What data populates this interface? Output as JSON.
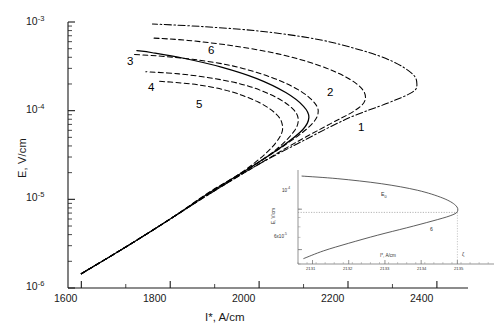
{
  "chart_data": {
    "type": "line",
    "title": "",
    "xlabel": "I*, A/cm",
    "ylabel": "E, V/cm",
    "yscale": "log",
    "xscale": "linear",
    "xlim": [
      1570,
      2470
    ],
    "ylim": [
      1e-06,
      0.001
    ],
    "grid": false,
    "legend": "inline-labels",
    "xticks": [
      1600,
      1800,
      2000,
      2200,
      2400
    ],
    "xtick_labels": [
      "1600",
      "1800",
      "2000",
      "2200",
      "2400"
    ],
    "yticks": [
      1e-06,
      1e-05,
      0.0001,
      0.001
    ],
    "ytick_labels": [
      "10-6",
      "10-5",
      "10-4",
      "10-3"
    ],
    "ytick_mantissa": "10",
    "ytick_exponents": [
      "-6",
      "-5",
      "-4",
      "-3"
    ],
    "series": [
      {
        "name": "1",
        "label": "1",
        "style": "dash-dot",
        "label_x": 2265,
        "label_y": 2.3e-05,
        "turning_point": [
          2350,
          0.00016
        ],
        "points": [
          [
            1600,
            1.45e-06
          ],
          [
            1700,
            2.9e-06
          ],
          [
            1800,
            6e-06
          ],
          [
            1900,
            1.25e-05
          ],
          [
            2000,
            2.5e-05
          ],
          [
            2100,
            4.6e-05
          ],
          [
            2200,
            8.2e-05
          ],
          [
            2290,
            0.000122
          ],
          [
            2345,
            0.000162
          ],
          [
            2355,
            0.0002
          ],
          [
            2345,
            0.00026
          ],
          [
            2300,
            0.00036
          ],
          [
            2230,
            0.00048
          ],
          [
            2130,
            0.00064
          ],
          [
            2000,
            0.00079
          ],
          [
            1870,
            0.00089
          ],
          [
            1760,
            0.00095
          ]
        ]
      },
      {
        "name": "2",
        "label": "2",
        "style": "dashed",
        "label_x": 2175,
        "label_y": 6e-05,
        "turning_point": [
          2235,
          0.00012
        ],
        "points": [
          [
            1600,
            1.45e-06
          ],
          [
            1700,
            2.9e-06
          ],
          [
            1800,
            6e-06
          ],
          [
            1900,
            1.25e-05
          ],
          [
            2000,
            2.5e-05
          ],
          [
            2080,
            4.3e-05
          ],
          [
            2160,
            7.1e-05
          ],
          [
            2215,
            0.0001
          ],
          [
            2238,
            0.00013
          ],
          [
            2232,
            0.000175
          ],
          [
            2195,
            0.00024
          ],
          [
            2130,
            0.00033
          ],
          [
            2040,
            0.00044
          ],
          [
            1940,
            0.00054
          ],
          [
            1840,
            0.00062
          ],
          [
            1760,
            0.00066
          ]
        ]
      },
      {
        "name": "3",
        "label": "3",
        "style": "dashed",
        "label_x": 1718,
        "label_y": 0.00036,
        "turning_point": [
          2130,
          9e-05
        ],
        "points": [
          [
            1600,
            1.45e-06
          ],
          [
            1700,
            2.9e-06
          ],
          [
            1800,
            6e-06
          ],
          [
            1890,
            1.2e-05
          ],
          [
            1975,
            2.2e-05
          ],
          [
            2055,
            4e-05
          ],
          [
            2110,
            6.4e-05
          ],
          [
            2132,
            9e-05
          ],
          [
            2126,
            0.00012
          ],
          [
            2090,
            0.00017
          ],
          [
            2025,
            0.00024
          ],
          [
            1940,
            0.00032
          ],
          [
            1850,
            0.00038
          ],
          [
            1770,
            0.000415
          ],
          [
            1718,
            0.00043
          ]
        ]
      },
      {
        "name": "4",
        "label": "4",
        "style": "dashed",
        "label_x": 1745,
        "label_y": 0.00021,
        "turning_point": [
          2085,
          7.6e-05
        ],
        "points": [
          [
            1600,
            1.45e-06
          ],
          [
            1700,
            2.9e-06
          ],
          [
            1800,
            6e-06
          ],
          [
            1890,
            1.2e-05
          ],
          [
            1970,
            2.1e-05
          ],
          [
            2040,
            3.7e-05
          ],
          [
            2078,
            5.8e-05
          ],
          [
            2088,
            7.8e-05
          ],
          [
            2078,
            0.000102
          ],
          [
            2040,
            0.00014
          ],
          [
            1975,
            0.00019
          ],
          [
            1900,
            0.00023
          ],
          [
            1820,
            0.00026
          ],
          [
            1745,
            0.000275
          ]
        ]
      },
      {
        "name": "5",
        "label": "5",
        "style": "dashed",
        "label_x": 1960,
        "label_y": 4.6e-05,
        "turning_point": [
          2050,
          6.4e-05
        ],
        "points": [
          [
            1600,
            1.45e-06
          ],
          [
            1700,
            2.9e-06
          ],
          [
            1800,
            6e-06
          ],
          [
            1885,
            1.18e-05
          ],
          [
            1960,
            2e-05
          ],
          [
            2018,
            3.4e-05
          ],
          [
            2048,
            5.2e-05
          ],
          [
            2052,
            7e-05
          ],
          [
            2038,
            9.2e-05
          ],
          [
            1998,
            0.000125
          ],
          [
            1935,
            0.000165
          ],
          [
            1865,
            0.000195
          ],
          [
            1800,
            0.00021
          ],
          [
            1770,
            0.000215
          ]
        ]
      },
      {
        "name": "6",
        "label": "6",
        "style": "solid",
        "label_x": 1925,
        "label_y": 0.00045,
        "turning_point": [
          2108,
          8.4e-05
        ],
        "points": [
          [
            1600,
            1.45e-06
          ],
          [
            1700,
            2.9e-06
          ],
          [
            1800,
            6e-06
          ],
          [
            1890,
            1.2e-05
          ],
          [
            1975,
            2.2e-05
          ],
          [
            2050,
            3.9e-05
          ],
          [
            2098,
            6.1e-05
          ],
          [
            2112,
            8.4e-05
          ],
          [
            2100,
            0.000112
          ],
          [
            2060,
            0.00016
          ],
          [
            1995,
            0.00023
          ],
          [
            1915,
            0.00031
          ],
          [
            1830,
            0.00039
          ],
          [
            1760,
            0.00045
          ],
          [
            1725,
            0.000475
          ]
        ]
      }
    ],
    "inset": {
      "type": "line",
      "xlabel": "I*, A/cm",
      "ylabel": "E, V/cm",
      "yscale": "log",
      "xlim": [
        2130.6,
        2135.9
      ],
      "ylim": [
        5e-05,
        0.00016
      ],
      "xticks": [
        2131,
        2132,
        2133,
        2134,
        2135
      ],
      "xtick_labels": [
        "2131",
        "2132",
        "2133",
        "2134",
        "2135"
      ],
      "yticks": [
        6e-05,
        0.0001
      ],
      "ytick_labels": [
        "6x10-5",
        "10-4"
      ],
      "annotations": [
        {
          "name": "E0",
          "text": "E",
          "sub": "0",
          "x": 2133.0,
          "y": 9.6e-05
        },
        {
          "name": "curve-6-label",
          "text": "6",
          "x": 2134.3,
          "y": 6.6e-05
        },
        {
          "name": "zeta",
          "text": "ζ",
          "x": 2135.2,
          "y": 5.4e-05
        }
      ],
      "turning_point": [
        2135.0,
        9.6e-05
      ],
      "points": [
        [
          2130.75,
          5.35e-05
        ],
        [
          2131.3,
          5.9e-05
        ],
        [
          2132.0,
          6.5e-05
        ],
        [
          2132.8,
          7.2e-05
        ],
        [
          2133.6,
          7.9e-05
        ],
        [
          2134.3,
          8.6e-05
        ],
        [
          2134.8,
          9.2e-05
        ],
        [
          2135.0,
          9.7e-05
        ],
        [
          2134.95,
          0.000105
        ],
        [
          2134.6,
          0.000115
        ],
        [
          2133.9,
          0.000127
        ],
        [
          2132.9,
          0.000138
        ],
        [
          2131.7,
          0.000147
        ],
        [
          2130.7,
          0.000152
        ]
      ]
    }
  },
  "axes": {
    "y_title": "E, V/cm",
    "x_title_main": "I*",
    "x_title_units": ", A/cm",
    "x_title_full": "I*, A/cm"
  },
  "tick_text": {
    "x": [
      "1600",
      "1800",
      "2000",
      "2200",
      "2400"
    ],
    "y_mantissa": "10",
    "y_exponents": [
      "-3",
      "-4",
      "-5",
      "-6"
    ]
  },
  "curve_labels": [
    "1",
    "2",
    "3",
    "4",
    "5",
    "6"
  ],
  "inset_text": {
    "x_title_main": "I*",
    "x_title_units": ", A/cm",
    "y_title": "E, V/cm",
    "xticks": [
      "2131",
      "2132",
      "2133",
      "2134",
      "2135"
    ],
    "ytick_upper_mantissa": "10",
    "ytick_upper_exp": "-4",
    "ytick_lower": "6x10",
    "ytick_lower_exp": "-5",
    "label_e0": "E",
    "label_e0_sub": "0",
    "label_curve": "6",
    "label_zeta": "ζ"
  },
  "colors": {
    "axis": "#1a1a1a",
    "curve": "#000000",
    "inset_axis": "#555555",
    "background": "#ffffff"
  }
}
